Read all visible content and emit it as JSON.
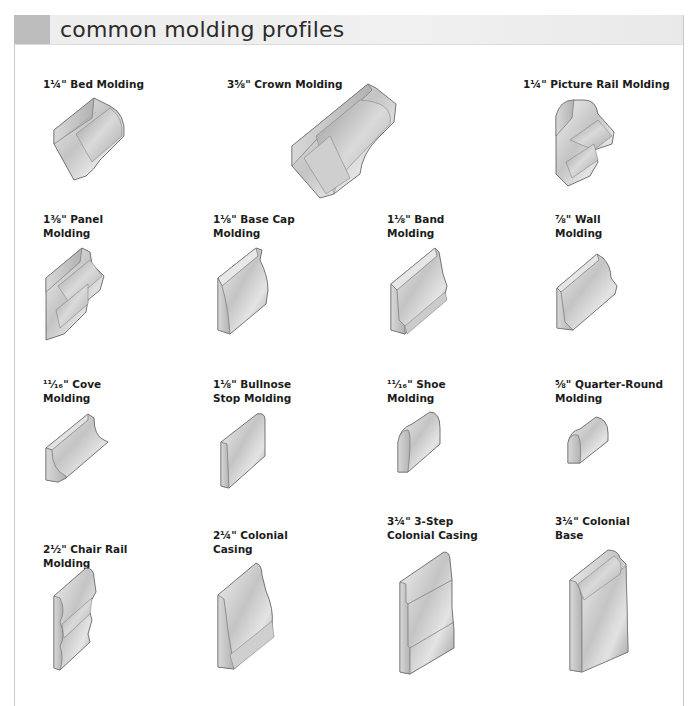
{
  "header": {
    "title": "common molding profiles",
    "swatch_color": "#bdbdbd",
    "bar_color": "#ededed"
  },
  "moldings": [
    {
      "id": "bed",
      "size": "1¼\"",
      "line1": "1¼\" Bed Molding",
      "line2": ""
    },
    {
      "id": "crown",
      "size": "3⅝\"",
      "line1": "3⅝\" Crown Molding",
      "line2": ""
    },
    {
      "id": "picture-rail",
      "size": "1¼\"",
      "line1": "1¼\" Picture Rail Molding",
      "line2": ""
    },
    {
      "id": "panel",
      "size": "1⅜\"",
      "line1": "1⅜\" Panel",
      "line2": "Molding"
    },
    {
      "id": "base-cap",
      "size": "1⅛\"",
      "line1": "1⅛\" Base Cap",
      "line2": "Molding"
    },
    {
      "id": "band",
      "size": "1⅛\"",
      "line1": "1⅛\" Band",
      "line2": "Molding"
    },
    {
      "id": "wall",
      "size": "⅞\"",
      "line1": "⅞\" Wall",
      "line2": "Molding"
    },
    {
      "id": "cove",
      "size": "11⁄16\"",
      "line1": "¹¹⁄₁₆\" Cove",
      "line2": "Molding"
    },
    {
      "id": "bullnose-stop",
      "size": "1⅛\"",
      "line1": "1⅛\" Bullnose",
      "line2": "Stop Molding"
    },
    {
      "id": "shoe",
      "size": "11⁄16\"",
      "line1": "¹¹⁄₁₆\" Shoe",
      "line2": "Molding"
    },
    {
      "id": "quarter-round",
      "size": "⅝\"",
      "line1": "⅝\" Quarter-Round",
      "line2": "Molding"
    },
    {
      "id": "chair-rail",
      "size": "2½\"",
      "line1": "2½\" Chair Rail",
      "line2": "Molding"
    },
    {
      "id": "colonial-casing",
      "size": "2¼\"",
      "line1": "2¼\" Colonial",
      "line2": "Casing"
    },
    {
      "id": "3-step-casing",
      "size": "3¼\"",
      "line1": "3¼\" 3-Step",
      "line2": "Colonial Casing"
    },
    {
      "id": "colonial-base",
      "size": "3¼\"",
      "line1": "3¼\" Colonial",
      "line2": "Base"
    }
  ],
  "colors": {
    "wood_light": "#e6e6e6",
    "wood_mid": "#b9b9b9",
    "wood_dark": "#8a8a8a",
    "outline": "#555555",
    "frame": "#c8c8c8"
  }
}
